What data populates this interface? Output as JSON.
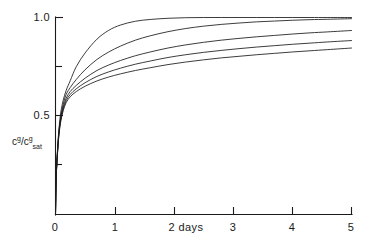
{
  "chart_data": {
    "type": "line",
    "title": "",
    "subtitle": "",
    "xlabel": "2 days",
    "ylabel": "c^g/c^g_sat",
    "ylabel_parts": {
      "base1": "c",
      "sup1": "g",
      "slash": "/",
      "base2": "c",
      "sup2": "g",
      "sub2": "sat"
    },
    "xlim": [
      0,
      5
    ],
    "ylim": [
      0,
      1.0
    ],
    "grid": false,
    "legend": null,
    "x_ticks": [
      0,
      1,
      2,
      3,
      4,
      5
    ],
    "x_tick_labels": [
      "0",
      "1",
      "2 days",
      "3",
      "4",
      "5"
    ],
    "y_ticks": [
      0,
      0.25,
      0.5,
      0.75,
      1.0
    ],
    "y_tick_labels": [
      "",
      "",
      "0.5",
      "",
      "1.0"
    ],
    "x": [
      0,
      0.01,
      0.02,
      0.04,
      0.06,
      0.09,
      0.13,
      0.18,
      0.25,
      0.35,
      0.5,
      0.7,
      0.9,
      1.1,
      1.35,
      1.6,
      1.9,
      2.2,
      2.5,
      2.8,
      3.1,
      3.4,
      3.7,
      4.0,
      4.3,
      4.6,
      5.0
    ],
    "series": [
      {
        "name": "curve-1",
        "values": [
          0,
          0.17,
          0.25,
          0.36,
          0.44,
          0.52,
          0.58,
          0.63,
          0.68,
          0.75,
          0.82,
          0.89,
          0.935,
          0.962,
          0.981,
          0.99,
          0.996,
          0.999,
          1.0,
          1.0,
          1.0,
          1.0,
          1.0,
          1.0,
          1.0,
          1.0,
          1.0
        ]
      },
      {
        "name": "curve-2",
        "values": [
          0,
          0.17,
          0.25,
          0.35,
          0.43,
          0.5,
          0.56,
          0.61,
          0.645,
          0.685,
          0.735,
          0.787,
          0.825,
          0.855,
          0.885,
          0.907,
          0.928,
          0.944,
          0.956,
          0.965,
          0.972,
          0.978,
          0.982,
          0.986,
          0.989,
          0.991,
          0.994
        ]
      },
      {
        "name": "curve-3",
        "values": [
          0,
          0.17,
          0.245,
          0.345,
          0.42,
          0.49,
          0.545,
          0.59,
          0.625,
          0.655,
          0.692,
          0.731,
          0.759,
          0.782,
          0.806,
          0.825,
          0.845,
          0.861,
          0.874,
          0.885,
          0.894,
          0.902,
          0.909,
          0.916,
          0.922,
          0.927,
          0.934
        ]
      },
      {
        "name": "curve-4",
        "values": [
          0,
          0.17,
          0.245,
          0.34,
          0.415,
          0.482,
          0.535,
          0.578,
          0.61,
          0.638,
          0.669,
          0.701,
          0.724,
          0.743,
          0.763,
          0.779,
          0.797,
          0.811,
          0.823,
          0.833,
          0.842,
          0.85,
          0.857,
          0.864,
          0.87,
          0.876,
          0.883
        ]
      },
      {
        "name": "curve-5",
        "values": [
          0,
          0.17,
          0.24,
          0.335,
          0.41,
          0.475,
          0.527,
          0.568,
          0.598,
          0.624,
          0.651,
          0.678,
          0.698,
          0.714,
          0.731,
          0.745,
          0.761,
          0.774,
          0.785,
          0.795,
          0.803,
          0.811,
          0.818,
          0.825,
          0.831,
          0.837,
          0.845
        ]
      }
    ],
    "colors": {
      "line": "#1a1a1a",
      "axis": "#1a1a1a",
      "background": "#ffffff"
    }
  }
}
